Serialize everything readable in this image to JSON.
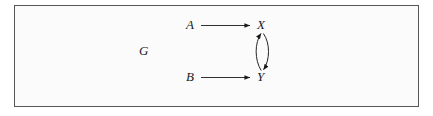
{
  "figure": {
    "graph_name": "G",
    "nodes": [
      {
        "id": "A",
        "label": "A",
        "x": 190,
        "y": 25
      },
      {
        "id": "X",
        "label": "X",
        "x": 262,
        "y": 25
      },
      {
        "id": "B",
        "label": "B",
        "x": 190,
        "y": 77
      },
      {
        "id": "Y",
        "label": "Y",
        "x": 262,
        "y": 77
      }
    ],
    "edges": [
      {
        "from": "A",
        "to": "X",
        "style": "straight",
        "direction": "forward"
      },
      {
        "from": "B",
        "to": "Y",
        "style": "straight",
        "direction": "forward"
      },
      {
        "from": "X",
        "to": "Y",
        "style": "curved",
        "direction": "forward"
      },
      {
        "from": "Y",
        "to": "X",
        "style": "curved",
        "direction": "forward"
      }
    ],
    "colors": {
      "background": "#ffffff",
      "panel": "#fbfbfb",
      "border": "#565656",
      "ink": "#1a1a1a"
    }
  }
}
